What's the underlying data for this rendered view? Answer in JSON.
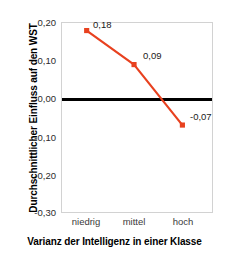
{
  "chart_data": {
    "type": "line",
    "title": "",
    "xlabel": "Varianz der Intelligenz in einer Klasse",
    "ylabel": "Durchschnittlicher Einfluss auf den WST",
    "categories": [
      "niedrig",
      "mittel",
      "hoch"
    ],
    "values": [
      0.18,
      0.09,
      -0.07
    ],
    "point_labels": [
      "0,18",
      "0,09",
      "-0,07"
    ],
    "ylim": [
      -0.3,
      0.2
    ],
    "ytick_values": [
      0.2,
      0.1,
      0.0,
      -0.1,
      -0.2,
      -0.3
    ],
    "ytick_labels": [
      "0,20",
      "0,10",
      "0,00",
      "-0,10",
      "-0,20",
      "-0,30"
    ],
    "grid": false,
    "legend": "none",
    "series_color": "#E8411F",
    "zero_line_color": "#000000",
    "plot_border_color": "#D2D2D2",
    "marker": "square"
  }
}
